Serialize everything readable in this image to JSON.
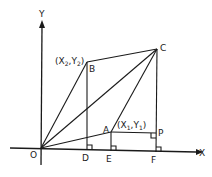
{
  "diagram": {
    "type": "coordinate-geometry",
    "axes": {
      "x_label": "X",
      "y_label": "Y",
      "origin_label": "O"
    },
    "points": {
      "O": {
        "label": "O"
      },
      "A": {
        "label": "A",
        "coord_label": "(X",
        "coord_sub1": "1",
        "coord_mid": ",Y",
        "coord_sub2": "1",
        "coord_end": ")"
      },
      "B": {
        "label": "B",
        "coord_label": "(X",
        "coord_sub1": "2",
        "coord_mid": ",Y",
        "coord_sub2": "2",
        "coord_end": ")"
      },
      "C": {
        "label": "C"
      },
      "D": {
        "label": "D"
      },
      "E": {
        "label": "E"
      },
      "F": {
        "label": "F"
      },
      "P": {
        "label": "P"
      }
    },
    "segments": [
      "OB",
      "OC",
      "OA",
      "BC",
      "AC",
      "BD",
      "AE",
      "CF",
      "AP"
    ],
    "right_angles": [
      "D",
      "E",
      "F",
      "P"
    ],
    "stroke_color": "#1a1a1a",
    "background": "#ffffff"
  }
}
